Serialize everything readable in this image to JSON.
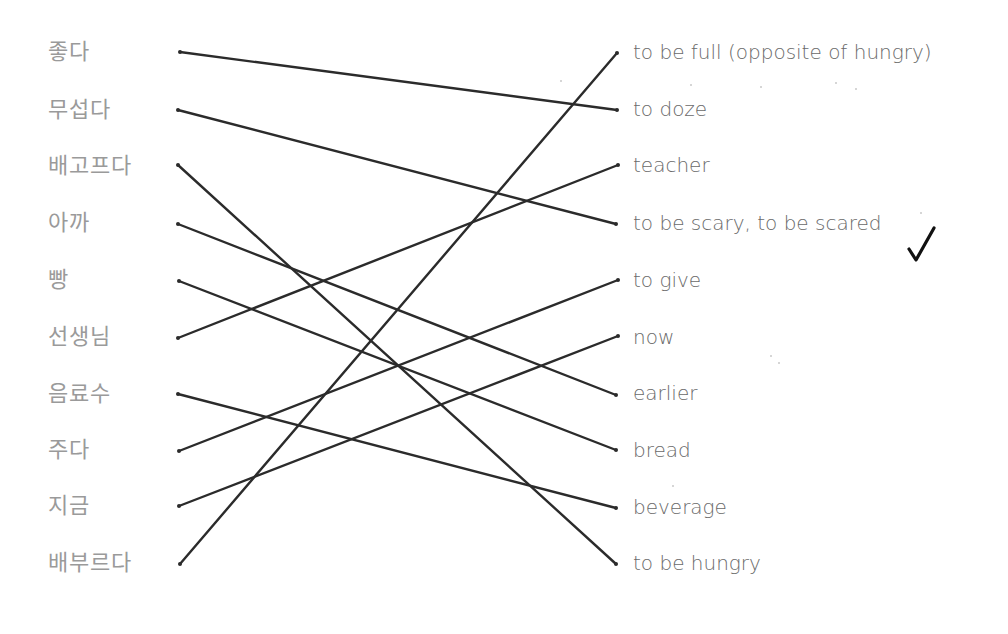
{
  "worksheet": {
    "left_column": [
      {
        "word": "좋다",
        "y": 52
      },
      {
        "word": "무섭다",
        "y": 110
      },
      {
        "word": "배고프다",
        "y": 166
      },
      {
        "word": "아까",
        "y": 223
      },
      {
        "word": "빵",
        "y": 280
      },
      {
        "word": "선생님",
        "y": 337
      },
      {
        "word": "음료수",
        "y": 394
      },
      {
        "word": "주다",
        "y": 450
      },
      {
        "word": "지금",
        "y": 506
      },
      {
        "word": "배부르다",
        "y": 563
      }
    ],
    "right_column": [
      {
        "word": "to be full (opposite of hungry)",
        "y": 52
      },
      {
        "word": "to doze",
        "y": 109
      },
      {
        "word": "teacher",
        "y": 165
      },
      {
        "word": "to be scary, to be scared",
        "y": 223
      },
      {
        "word": "to give",
        "y": 280
      },
      {
        "word": "now",
        "y": 337
      },
      {
        "word": "earlier",
        "y": 393
      },
      {
        "word": "bread",
        "y": 450
      },
      {
        "word": "beverage",
        "y": 507
      },
      {
        "word": "to be hungry",
        "y": 563
      }
    ],
    "matches": [
      {
        "left": "좋다",
        "right": "to doze"
      },
      {
        "left": "무섭다",
        "right": "to be scary, to be scared"
      },
      {
        "left": "배고프다",
        "right": "to be hungry"
      },
      {
        "left": "아까",
        "right": "earlier"
      },
      {
        "left": "빵",
        "right": "bread"
      },
      {
        "left": "선생님",
        "right": "teacher"
      },
      {
        "left": "음료수",
        "right": "beverage"
      },
      {
        "left": "주다",
        "right": "to give"
      },
      {
        "left": "지금",
        "right": "now"
      },
      {
        "left": "배부르다",
        "right": "to be full (opposite of hungry)"
      }
    ],
    "check_mark": "✓",
    "line_color": "#2b2b2b"
  }
}
